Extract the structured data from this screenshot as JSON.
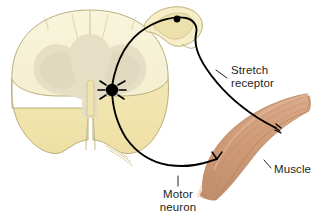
{
  "figure": {
    "background_color": "#ffffff",
    "width": 312,
    "height": 220
  },
  "labels": {
    "stretch_receptor": {
      "line1": "Stretch",
      "line2": "receptor"
    },
    "motor_neuron": {
      "line1": "Motor",
      "line2": "neuron"
    },
    "muscle": {
      "line1": "Muscle"
    }
  },
  "structures": {
    "spinal_cord": {
      "name": "spinal cord cross-section",
      "white_matter_upper_color": "#f7f2d4",
      "white_matter_lower_color": "#f2e5ae",
      "gray_matter_color": "#e6e0c8",
      "outline_color": "#b9ad7e",
      "central_canal_color": "#efe4b0"
    },
    "dorsal_root_ganglion": {
      "name": "dorsal root ganglion",
      "fill_color": "#f5ecc8",
      "inner_color": "#ece0ab",
      "outline_color": "#bfae79"
    },
    "muscle_body": {
      "name": "skeletal muscle",
      "fill_color": "#cf9a77",
      "highlight_color": "#ddb094",
      "tendon_color": "#f3ded0",
      "striation_color": "#bd8564"
    },
    "neurons": {
      "axon_color": "#000000",
      "soma_color": "#000000",
      "sensory_axon_name": "sensory-afferent-axon",
      "motor_axon_name": "motor-efferent-axon",
      "motor_soma_name": "motor-neuron-cell-body",
      "sensory_soma_name": "sensory-neuron-cell-body"
    }
  },
  "text_color": "#231f20"
}
